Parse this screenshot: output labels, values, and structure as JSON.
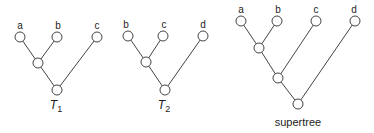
{
  "diagram": {
    "type": "phylogenetic-trees",
    "trees": [
      {
        "id": "T1",
        "label_main": "T",
        "label_sub": "1",
        "leaves": [
          "a",
          "b",
          "c"
        ],
        "topology": "((a,b),c)"
      },
      {
        "id": "T2",
        "label_main": "T",
        "label_sub": "2",
        "leaves": [
          "b",
          "c",
          "d"
        ],
        "topology": "((b,c),d)"
      },
      {
        "id": "supertree",
        "label_main": "supertree",
        "label_sub": "",
        "leaves": [
          "a",
          "b",
          "c",
          "d"
        ],
        "topology": "(((a,b),c),d)"
      }
    ]
  }
}
